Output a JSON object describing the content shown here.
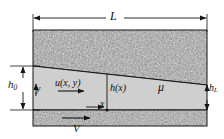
{
  "figure": {
    "type": "engineering-schematic"
  },
  "labels": {
    "length": "L",
    "gap_inlet": "h",
    "gap_inlet_sub": "0",
    "gap_outlet": "h",
    "gap_outlet_sub": "L",
    "velocity_profile": "u(x, y)",
    "gap_function": "h(x)",
    "viscosity": "μ",
    "axis_x": "x",
    "axis_y": "y",
    "wall_velocity": "V"
  },
  "colors": {
    "fluid_fill": "#cfcfcf",
    "solid_speckle_base": "#9a9a9a",
    "line": "#151515",
    "background": "#ffffff"
  },
  "geometry": {
    "block_left_x": 33,
    "block_right_x": 207,
    "upper_block_top_y": 30,
    "fluid_top_left_y": 66,
    "fluid_top_right_y": 85,
    "fluid_bottom_y": 110,
    "lower_block_bottom_y": 126,
    "dimension_line_y": 18,
    "h_x_station_x": 107
  }
}
